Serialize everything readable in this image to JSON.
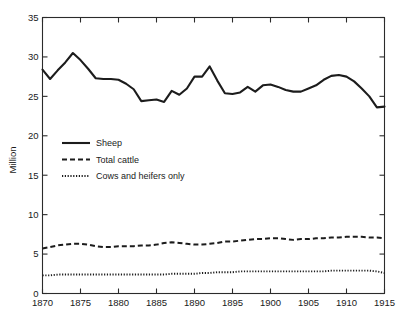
{
  "figure": {
    "title_partial": "",
    "yaxis_title": "Million"
  },
  "legend": {
    "items": [
      {
        "label": "Sheep",
        "style": "solid",
        "icon": "solid-line-icon"
      },
      {
        "label": "Total cattle",
        "style": "dashed",
        "icon": "dashed-line-icon"
      },
      {
        "label": "Cows and heifers only",
        "style": "dotted",
        "icon": "dotted-line-icon"
      }
    ]
  },
  "axes": {
    "y_ticks": [
      "0",
      "5",
      "10",
      "15",
      "20",
      "25",
      "30",
      "35"
    ],
    "x_ticks": [
      "1870",
      "1875",
      "1880",
      "1885",
      "1890",
      "1895",
      "1900",
      "1905",
      "1910",
      "1915"
    ]
  },
  "chart_data": {
    "type": "line",
    "title": "",
    "xlabel": "",
    "ylabel": "Million",
    "xlim": [
      1870,
      1915
    ],
    "ylim": [
      0,
      35
    ],
    "grid": false,
    "legend_position": "inside-left",
    "x": [
      1870,
      1871,
      1872,
      1873,
      1874,
      1875,
      1876,
      1877,
      1878,
      1879,
      1880,
      1881,
      1882,
      1883,
      1884,
      1885,
      1886,
      1887,
      1888,
      1889,
      1890,
      1891,
      1892,
      1893,
      1894,
      1895,
      1896,
      1897,
      1898,
      1899,
      1900,
      1901,
      1902,
      1903,
      1904,
      1905,
      1906,
      1907,
      1908,
      1909,
      1910,
      1911,
      1912,
      1913,
      1914,
      1915
    ],
    "series": [
      {
        "name": "Sheep",
        "style": "solid",
        "values": [
          28.4,
          27.2,
          28.3,
          29.3,
          30.5,
          29.6,
          28.5,
          27.3,
          27.2,
          27.2,
          27.1,
          26.6,
          25.9,
          24.4,
          24.5,
          24.6,
          24.3,
          25.7,
          25.2,
          26.0,
          27.5,
          27.5,
          28.8,
          27.0,
          25.4,
          25.3,
          25.5,
          26.2,
          25.6,
          26.4,
          26.5,
          26.2,
          25.8,
          25.6,
          25.6,
          26.0,
          26.4,
          27.1,
          27.6,
          27.7,
          27.5,
          26.9,
          26.0,
          25.0,
          23.6,
          23.7
        ]
      },
      {
        "name": "Total cattle",
        "style": "dashed",
        "values": [
          5.7,
          5.9,
          6.1,
          6.2,
          6.3,
          6.3,
          6.2,
          6.0,
          5.9,
          5.9,
          6.0,
          6.0,
          6.0,
          6.1,
          6.1,
          6.2,
          6.4,
          6.5,
          6.4,
          6.3,
          6.2,
          6.2,
          6.3,
          6.4,
          6.6,
          6.6,
          6.7,
          6.8,
          6.9,
          6.9,
          7.0,
          7.0,
          6.9,
          6.8,
          6.9,
          6.9,
          7.0,
          7.0,
          7.1,
          7.1,
          7.2,
          7.2,
          7.2,
          7.1,
          7.1,
          7.0
        ]
      },
      {
        "name": "Cows and heifers only",
        "style": "dotted",
        "values": [
          2.3,
          2.3,
          2.4,
          2.4,
          2.4,
          2.4,
          2.4,
          2.4,
          2.4,
          2.4,
          2.4,
          2.4,
          2.4,
          2.4,
          2.4,
          2.4,
          2.4,
          2.5,
          2.5,
          2.5,
          2.5,
          2.6,
          2.6,
          2.7,
          2.7,
          2.7,
          2.8,
          2.8,
          2.8,
          2.8,
          2.8,
          2.8,
          2.8,
          2.8,
          2.8,
          2.8,
          2.8,
          2.8,
          2.9,
          2.9,
          2.9,
          2.9,
          2.9,
          2.9,
          2.8,
          2.6
        ]
      }
    ]
  }
}
